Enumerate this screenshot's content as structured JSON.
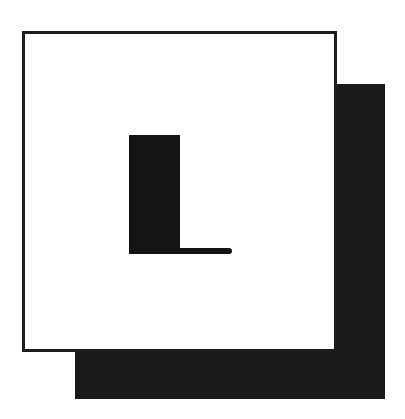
{
  "dropcap": {
    "letter": "L",
    "colors": {
      "background": "#ffffff",
      "frame_border": "#1c1c1c",
      "shadow": "#1a1a1a",
      "glyph": "#141414"
    }
  }
}
